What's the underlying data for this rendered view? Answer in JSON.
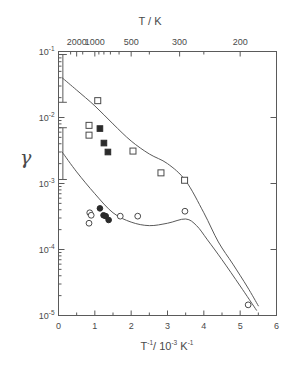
{
  "figure": {
    "y_axis_label": "γ",
    "x_axis_title_main": "T",
    "x_axis_title_exp": "-1",
    "x_axis_title_rest": "/ 10",
    "x_axis_title_exp2": "-3",
    "x_axis_title_unit": "K",
    "x_axis_title_exp3": "-1",
    "top_axis_title": "T / K",
    "bottom_caption": ""
  },
  "chart_data": {
    "type": "scatter",
    "title": "",
    "xlabel": "T⁻¹/ 10⁻³ K⁻¹",
    "ylabel": "γ",
    "xlim": [
      0,
      6
    ],
    "ylim": [
      1e-05,
      0.1
    ],
    "yscale": "log",
    "xscale": "linear",
    "grid": false,
    "legend": "none",
    "x_ticks": [
      0,
      1,
      2,
      3,
      4,
      5,
      6
    ],
    "x_tick_labels": [
      "0",
      "1",
      "2",
      "3",
      "4",
      "5",
      "6"
    ],
    "y_ticks": [
      1e-05,
      0.0001,
      0.001,
      0.01,
      0.1
    ],
    "y_tick_labels": [
      "10-5",
      "10-4",
      "10-3",
      "10-2",
      "10-1"
    ],
    "secondary_x_axis": {
      "label": "T / K",
      "tick_values_K": [
        2000,
        1000,
        500,
        300,
        200
      ],
      "tick_labels": [
        "2000",
        "1000",
        "500",
        "300",
        "200"
      ],
      "tick_positions_invT": [
        0.5,
        1.0,
        2.0,
        3.3333,
        5.0
      ],
      "minor_tick_values_K": [
        3000,
        1500,
        900,
        800,
        700,
        600,
        400,
        250
      ],
      "minor_tick_positions_invT": [
        0.3333,
        0.6667,
        1.1111,
        1.25,
        1.4286,
        1.6667,
        2.5,
        4.0
      ]
    },
    "series": [
      {
        "name": "open-squares",
        "marker": "open-square",
        "points": [
          {
            "x": 1.08,
            "y": 0.018
          },
          {
            "x": 0.84,
            "y": 0.0076
          },
          {
            "x": 0.84,
            "y": 0.0054
          },
          {
            "x": 2.05,
            "y": 0.0031
          },
          {
            "x": 2.82,
            "y": 0.00145
          },
          {
            "x": 3.47,
            "y": 0.00112
          }
        ]
      },
      {
        "name": "filled-squares",
        "marker": "filled-square",
        "points": [
          {
            "x": 1.14,
            "y": 0.0068
          },
          {
            "x": 1.25,
            "y": 0.0041
          },
          {
            "x": 1.36,
            "y": 0.003
          }
        ]
      },
      {
        "name": "open-circles",
        "marker": "open-circle",
        "points": [
          {
            "x": 0.86,
            "y": 0.00036
          },
          {
            "x": 0.9,
            "y": 0.00033
          },
          {
            "x": 0.84,
            "y": 0.00025
          },
          {
            "x": 1.7,
            "y": 0.00032
          },
          {
            "x": 2.18,
            "y": 0.00032
          },
          {
            "x": 3.48,
            "y": 0.00038
          },
          {
            "x": 5.22,
            "y": 1.45e-05
          }
        ]
      },
      {
        "name": "filled-circles",
        "marker": "filled-circle",
        "points": [
          {
            "x": 1.14,
            "y": 0.00042
          },
          {
            "x": 1.24,
            "y": 0.00033
          },
          {
            "x": 1.3,
            "y": 0.00032
          },
          {
            "x": 1.38,
            "y": 0.00028
          }
        ]
      }
    ],
    "curves": [
      {
        "name": "upper-curve",
        "points": [
          {
            "x": 0.1,
            "y": 0.04
          },
          {
            "x": 0.5,
            "y": 0.026
          },
          {
            "x": 1.0,
            "y": 0.015
          },
          {
            "x": 1.5,
            "y": 0.008
          },
          {
            "x": 2.0,
            "y": 0.0044
          },
          {
            "x": 2.5,
            "y": 0.0028
          },
          {
            "x": 3.0,
            "y": 0.002
          },
          {
            "x": 3.5,
            "y": 0.0011
          },
          {
            "x": 4.0,
            "y": 0.00036
          },
          {
            "x": 4.4,
            "y": 0.00013
          },
          {
            "x": 4.8,
            "y": 6e-05
          },
          {
            "x": 5.2,
            "y": 2.7e-05
          },
          {
            "x": 5.5,
            "y": 1.4e-05
          }
        ]
      },
      {
        "name": "lower-curve",
        "points": [
          {
            "x": 0.1,
            "y": 0.003
          },
          {
            "x": 0.5,
            "y": 0.0015
          },
          {
            "x": 1.0,
            "y": 0.0007
          },
          {
            "x": 1.5,
            "y": 0.00036
          },
          {
            "x": 2.0,
            "y": 0.00026
          },
          {
            "x": 2.5,
            "y": 0.00023
          },
          {
            "x": 3.0,
            "y": 0.00025
          },
          {
            "x": 3.5,
            "y": 0.00029
          },
          {
            "x": 3.8,
            "y": 0.00023
          },
          {
            "x": 4.1,
            "y": 0.00014
          },
          {
            "x": 4.5,
            "y": 7e-05
          },
          {
            "x": 5.0,
            "y": 2.8e-05
          },
          {
            "x": 5.45,
            "y": 1.2e-05
          }
        ]
      }
    ],
    "error_bars": [
      {
        "name": "upper-error-bar",
        "x": 0.12,
        "y_low": 0.017,
        "y_high": 0.09
      },
      {
        "name": "lower-error-bar",
        "x": 0.12,
        "y_low": 0.00115,
        "y_high": 0.007
      }
    ]
  }
}
